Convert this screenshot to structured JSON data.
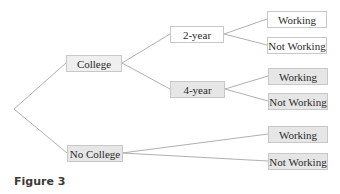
{
  "diagram": {
    "type": "tree",
    "root": {
      "label": ""
    },
    "level1": [
      {
        "id": "college",
        "label": "College"
      },
      {
        "id": "no_college",
        "label": "No College"
      }
    ],
    "level2": [
      {
        "id": "two_year",
        "parent": "college",
        "label": "2-year"
      },
      {
        "id": "four_year",
        "parent": "college",
        "label": "4-year"
      }
    ],
    "leaves": [
      {
        "parent": "two_year",
        "label": "Working"
      },
      {
        "parent": "two_year",
        "label": "Not Working"
      },
      {
        "parent": "four_year",
        "label": "Working"
      },
      {
        "parent": "four_year",
        "label": "Not Working"
      },
      {
        "parent": "no_college",
        "label": "Working"
      },
      {
        "parent": "no_college",
        "label": "Not Working"
      }
    ],
    "caption": "Figure 3",
    "colors": {
      "line": "#b0b0b0",
      "box_border": "#c8c8c8",
      "box_fill_gray": "#e6e6e6",
      "text": "#2a2a2a"
    }
  }
}
